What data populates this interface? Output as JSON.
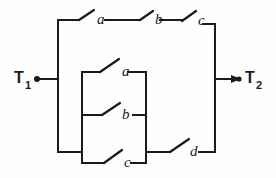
{
  "figure": {
    "kind": "switching-circuit-diagram",
    "background_color": "#fefefe",
    "line_color": "#1a1a1a"
  },
  "terminals": [
    {
      "id": "T1",
      "label": "T",
      "subscript": "1",
      "side": "left"
    },
    {
      "id": "T2",
      "label": "T",
      "subscript": "2",
      "side": "right"
    }
  ],
  "switches": {
    "top_branch": [
      {
        "id": "sw-top-a",
        "label": "a"
      },
      {
        "id": "sw-top-b",
        "label": "b"
      },
      {
        "id": "sw-top-c",
        "label": "c"
      }
    ],
    "inner_box": [
      {
        "id": "sw-inner-a",
        "label": "a"
      },
      {
        "id": "sw-inner-b",
        "label": "b"
      },
      {
        "id": "sw-inner-c",
        "label": "c"
      }
    ],
    "bottom_branch": [
      {
        "id": "sw-bottom-d",
        "label": "d"
      }
    ]
  },
  "labels": {
    "top_a": "a",
    "top_b": "b",
    "top_c": "c",
    "inner_a": "a",
    "inner_b": "b",
    "inner_c": "c",
    "bottom_d": "d",
    "terminal_left": "T",
    "terminal_left_sub": "1",
    "terminal_right": "T",
    "terminal_right_sub": "2"
  }
}
